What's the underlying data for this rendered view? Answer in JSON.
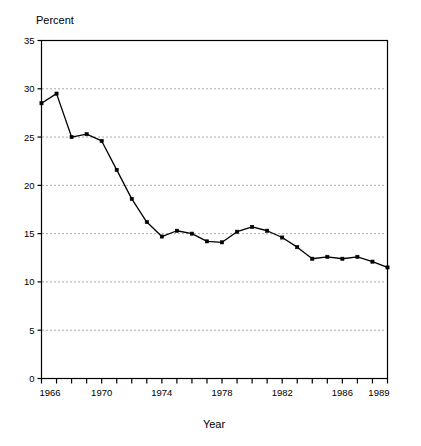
{
  "chart_data": {
    "type": "line",
    "title": "",
    "ylabel": "Percent",
    "xlabel": "Year",
    "ylim": [
      0,
      35
    ],
    "xlim": [
      1966,
      1989
    ],
    "yticks": [
      0,
      5,
      10,
      15,
      20,
      25,
      30,
      35
    ],
    "ytick_labels": [
      "0",
      "5",
      "10",
      "15",
      "20",
      "25",
      "30",
      "35"
    ],
    "xtick_labels": [
      "1966",
      "1970",
      "1974",
      "1978",
      "1982",
      "1986",
      "1989"
    ],
    "xtick_values": [
      1966,
      1970,
      1974,
      1978,
      1982,
      1986,
      1989
    ],
    "grid": "horizontal-dotted",
    "legend": "none",
    "markers": "filled-square",
    "line_color": "#000000",
    "grid_color": "#555555",
    "axis_color": "#000000",
    "background": "#ffffff",
    "x": [
      1966,
      1967,
      1968,
      1969,
      1970,
      1971,
      1972,
      1973,
      1974,
      1975,
      1976,
      1977,
      1978,
      1979,
      1980,
      1981,
      1982,
      1983,
      1984,
      1985,
      1986,
      1987,
      1988,
      1989
    ],
    "values": [
      28.5,
      29.5,
      25.0,
      25.3,
      24.6,
      21.6,
      18.6,
      16.2,
      14.7,
      15.3,
      15.0,
      14.2,
      14.1,
      15.2,
      15.7,
      15.3,
      14.6,
      13.6,
      12.4,
      12.6,
      12.4,
      12.6,
      12.1,
      11.5
    ],
    "series": [
      {
        "name": "Percent",
        "values": [
          28.5,
          29.5,
          25.0,
          25.3,
          24.6,
          21.6,
          18.6,
          16.2,
          14.7,
          15.3,
          15.0,
          14.2,
          14.1,
          15.2,
          15.7,
          15.3,
          14.6,
          13.6,
          12.4,
          12.6,
          12.4,
          12.6,
          12.1,
          11.5
        ]
      }
    ]
  }
}
